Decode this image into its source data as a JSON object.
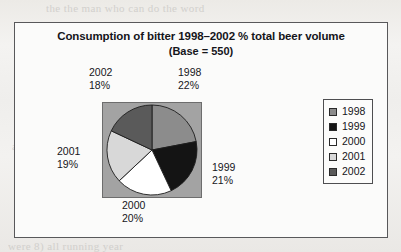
{
  "chart_data": {
    "type": "pie",
    "title": "Consumption of bitter 1998–2002 % total beer volume",
    "subtitle": "(Base = 550)",
    "categories": [
      "1998",
      "1999",
      "2000",
      "2001",
      "2002"
    ],
    "values": [
      22,
      21,
      20,
      19,
      18
    ],
    "value_suffix": "%",
    "base": 550,
    "colors": [
      "#8c8c8c",
      "#141414",
      "#ffffff",
      "#d8d8d8",
      "#5a5a5a"
    ],
    "slice_order_clockwise_from_12": [
      "1998",
      "1999",
      "2000",
      "2001",
      "2002"
    ],
    "legend_position": "right",
    "grid": false,
    "xlabel": "",
    "ylabel": "",
    "plot_background": "#a3a3a3",
    "labels": [
      {
        "year": "1998",
        "percent": "22%"
      },
      {
        "year": "1999",
        "percent": "21%"
      },
      {
        "year": "2000",
        "percent": "20%"
      },
      {
        "year": "2001",
        "percent": "19%"
      },
      {
        "year": "2002",
        "percent": "18%"
      }
    ]
  },
  "legend": {
    "items": [
      {
        "label": "1998",
        "color": "#8c8c8c"
      },
      {
        "label": "1999",
        "color": "#141414"
      },
      {
        "label": "2000",
        "color": "#ffffff"
      },
      {
        "label": "2001",
        "color": "#d8d8d8"
      },
      {
        "label": "2002",
        "color": "#5a5a5a"
      }
    ]
  },
  "scan_artifacts": {
    "lines": [
      "the the man who can do the word",
      "from the register and ask in an",
      "then a not a  Wagner was a",
      "a 1 and a 2 of the king but it is",
      "one so being of the spring con",
      "to here at the opposite",
      "were 8) all running year"
    ]
  }
}
